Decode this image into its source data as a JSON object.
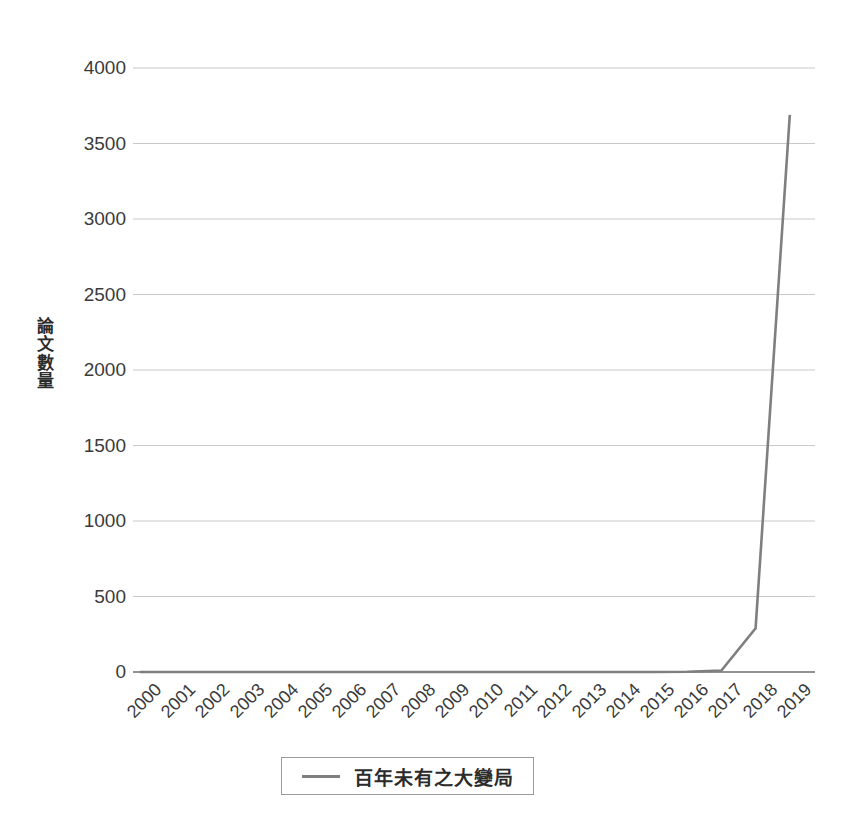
{
  "chart_data": {
    "type": "line",
    "title": "",
    "xlabel": "",
    "ylabel": "論文數量",
    "categories": [
      "2000",
      "2001",
      "2002",
      "2003",
      "2004",
      "2005",
      "2006",
      "2007",
      "2008",
      "2009",
      "2010",
      "2011",
      "2012",
      "2013",
      "2014",
      "2015",
      "2016",
      "2017",
      "2018",
      "2019"
    ],
    "series": [
      {
        "name": "百年未有之大變局",
        "color": "#7f7f7f",
        "values": [
          0,
          0,
          0,
          0,
          0,
          0,
          0,
          0,
          0,
          0,
          0,
          0,
          0,
          0,
          0,
          0,
          2,
          10,
          290,
          3690
        ]
      }
    ],
    "ylim": [
      0,
      4000
    ],
    "y_ticks": [
      0,
      500,
      1000,
      1500,
      2000,
      2500,
      3000,
      3500,
      4000
    ],
    "y_tick_labels": [
      "0",
      "500",
      "1000",
      "1500",
      "2000",
      "2500",
      "3000",
      "3500",
      "4000"
    ],
    "grid": true,
    "grid_axis": "y",
    "legend_position": "bottom",
    "x_tick_rotation": -45
  },
  "legend": {
    "entries": [
      {
        "label": "百年未有之大變局",
        "color": "#7f7f7f"
      }
    ]
  },
  "axes": {
    "y_title": "論文數量",
    "y_title_chars": [
      "論",
      "文",
      "數",
      "量"
    ]
  },
  "colors": {
    "line": "#7f7f7f",
    "grid": "#c9c9c9",
    "axis": "#6e6e6e",
    "text": "#3b3b3b",
    "background": "#ffffff",
    "legend_border": "#9a9a9a"
  }
}
